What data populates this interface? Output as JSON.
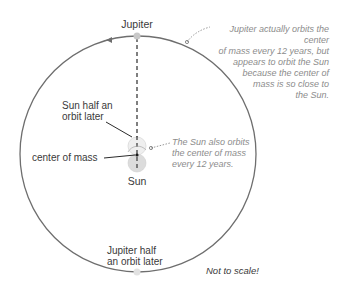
{
  "diagram": {
    "labels": {
      "jupiter": "Jupiter",
      "sun_half_orbit_line1": "Sun half an",
      "sun_half_orbit_line2": "orbit later",
      "center_of_mass": "center of mass",
      "sun": "Sun",
      "jupiter_half_orbit_line1": "Jupiter half",
      "jupiter_half_orbit_line2": "an orbit later",
      "not_to_scale": "Not to scale!"
    },
    "notes": {
      "jupiter_note": [
        "Jupiter actually orbits the center",
        "of mass every 12 years, but",
        "appears to orbit the Sun",
        "because the center of",
        "mass is so close to",
        "the Sun."
      ],
      "sun_note": [
        "The Sun also orbits",
        "the center of mass",
        "every 12 years."
      ]
    },
    "colors": {
      "orbit": "#6e6e6e",
      "note_text": "#8c8c8c",
      "label_text": "#3a3a3a",
      "sun_fill": "#dcdcdc",
      "dashed_line": "#2b2b2b"
    }
  }
}
